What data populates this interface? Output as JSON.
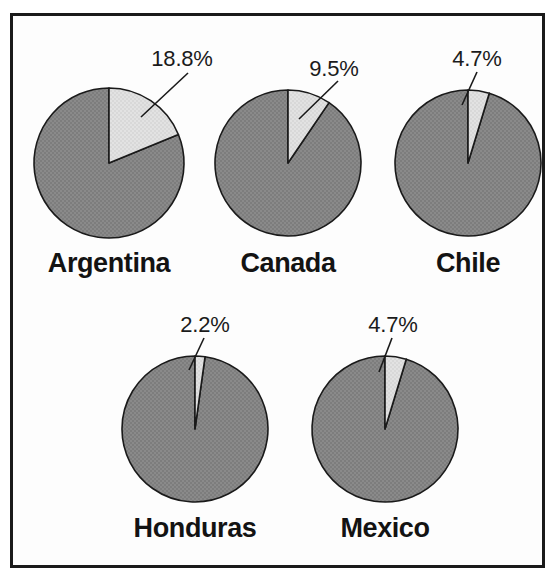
{
  "figure": {
    "title": "",
    "background": "#ffffff",
    "frame_color": "#1a1a1a",
    "slice_dark_color": "#878787",
    "slice_light_color": "#dedede",
    "outline_color": "#1a1a1a"
  },
  "chart_data": {
    "type": "pie",
    "title": "",
    "xlabel": "",
    "ylabel": "",
    "legend": [],
    "grid": false,
    "note": "Five small pie charts, one per country. Each pie shows a highlighted light-gray slice, labeled with its percentage, starting at 12 o'clock going clockwise; the remainder is dark gray.",
    "panels": [
      {
        "label": "Argentina",
        "value": 18.8,
        "value_label": "18.8%",
        "remainder": 81.2,
        "row": 0,
        "col": 0
      },
      {
        "label": "Canada",
        "value": 9.5,
        "value_label": "9.5%",
        "remainder": 90.5,
        "row": 0,
        "col": 1
      },
      {
        "label": "Chile",
        "value": 4.7,
        "value_label": "4.7%",
        "remainder": 95.3,
        "row": 0,
        "col": 2
      },
      {
        "label": "Honduras",
        "value": 2.2,
        "value_label": "2.2%",
        "remainder": 97.8,
        "row": 1,
        "col": 0
      },
      {
        "label": "Mexico",
        "value": 4.7,
        "value_label": "4.7%",
        "remainder": 95.3,
        "row": 1,
        "col": 1
      }
    ]
  },
  "geometry": {
    "pies": [
      {
        "cx": 109,
        "cy": 163,
        "r": 75,
        "label_x": 109,
        "label_y": 248,
        "pct_x": 182,
        "pct_y": 46,
        "leader_x1": 188,
        "leader_y1": 73,
        "leader_x2": 141,
        "leader_y2": 117
      },
      {
        "cx": 288,
        "cy": 163,
        "r": 73,
        "label_x": 288,
        "label_y": 248,
        "pct_x": 334,
        "pct_y": 56,
        "leader_x1": 338,
        "leader_y1": 81,
        "leader_x2": 299,
        "leader_y2": 119
      },
      {
        "cx": 468,
        "cy": 163,
        "r": 73,
        "label_x": 468,
        "label_y": 248,
        "pct_x": 477,
        "pct_y": 46,
        "leader_x1": 477,
        "leader_y1": 72,
        "leader_x2": 462,
        "leader_y2": 105
      },
      {
        "cx": 195,
        "cy": 429,
        "r": 73,
        "label_x": 195,
        "label_y": 513,
        "pct_x": 205,
        "pct_y": 312,
        "leader_x1": 204,
        "leader_y1": 338,
        "leader_x2": 189,
        "leader_y2": 370
      },
      {
        "cx": 385,
        "cy": 429,
        "r": 73,
        "label_x": 385,
        "label_y": 513,
        "pct_x": 393,
        "pct_y": 312,
        "leader_x1": 392,
        "leader_y1": 338,
        "leader_x2": 379,
        "leader_y2": 372
      }
    ]
  }
}
